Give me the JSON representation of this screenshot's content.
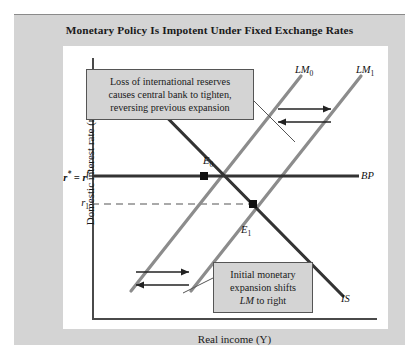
{
  "figure": {
    "title": "Monetary Policy Is Impotent Under Fixed Exchange Rates"
  },
  "axes": {
    "y_title": "Domestic interest rate (r)",
    "x_title": "Real income (Y)",
    "y_ticks": [
      {
        "id": "r-star",
        "label_html": "r* = r f"
      },
      {
        "id": "r-1",
        "label_html": "r1"
      }
    ]
  },
  "curves": [
    {
      "id": "lm0",
      "label": "LM0",
      "color": "#8c8c8c",
      "slope": "upward"
    },
    {
      "id": "lm1",
      "label": "LM1",
      "color": "#8c8c8c",
      "slope": "upward"
    },
    {
      "id": "bp",
      "label": "BP",
      "color": "#333333",
      "slope": "horizontal"
    },
    {
      "id": "is",
      "label": "IS",
      "color": "#333333",
      "slope": "downward"
    }
  ],
  "points": [
    {
      "id": "e0",
      "label": "E0",
      "description": "initial equilibrium at IS, LM0 and BP"
    },
    {
      "id": "e1",
      "label": "E1",
      "description": "temporary equilibrium at IS and LM1 below BP"
    }
  ],
  "annotations": [
    {
      "id": "reserves",
      "lines": [
        "Loss of international reserves",
        "causes central bank to tighten,",
        "reversing previous expansion"
      ]
    },
    {
      "id": "expansion",
      "lines": [
        "Initial monetary",
        "expansion shifts",
        "LM to right"
      ],
      "italic_term": "LM"
    }
  ],
  "shift_arrows": [
    {
      "id": "upper-right-rightward",
      "direction": "right"
    },
    {
      "id": "upper-right-leftward",
      "direction": "left"
    },
    {
      "id": "lower-left-rightward",
      "direction": "right"
    },
    {
      "id": "lower-left-leftward",
      "direction": "left"
    }
  ],
  "colors": {
    "panel_background": "#d4d4d4",
    "plot_background": "#ffffff",
    "lm_curve": "#8c8c8c",
    "is_bp_curve": "#333333",
    "axis": "#4a4a4a"
  }
}
